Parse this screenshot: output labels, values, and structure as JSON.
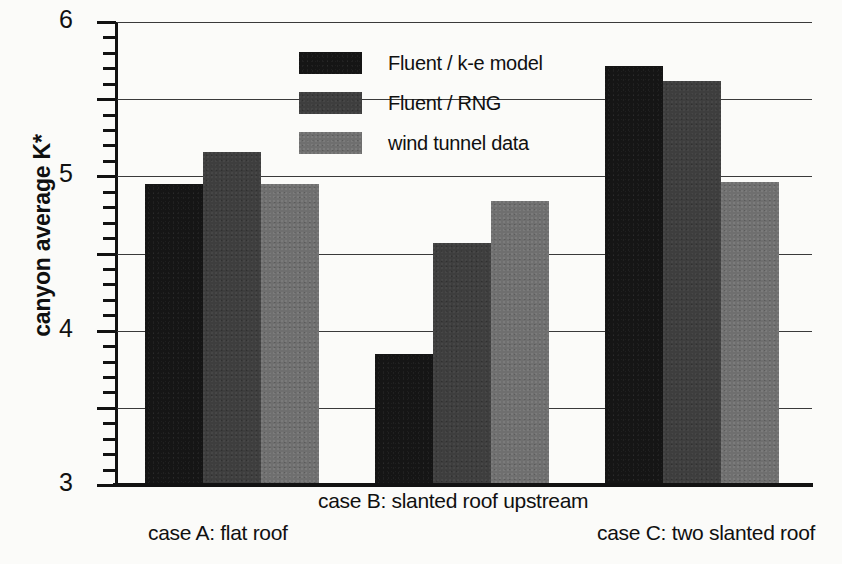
{
  "chart_data": {
    "type": "bar",
    "title": "",
    "xlabel": "",
    "ylabel": "canyon average K*",
    "ylim": [
      0,
      6
    ],
    "ytick_labels": [
      "6",
      "5",
      "4",
      "3",
      "2",
      "1",
      "0"
    ],
    "ytick_values": [
      6,
      5,
      4,
      3,
      2,
      1,
      0
    ],
    "minor_ticks_per_interval": 4,
    "grid": "horizontal",
    "legend_position": "upper-center",
    "categories": [
      "case A: flat roof",
      "case B: slanted roof upstream",
      "case C: two slanted roof"
    ],
    "series": [
      {
        "name": "Fluent / k-e model",
        "color": "#151515",
        "values": [
          3.88,
          1.67,
          5.4
        ]
      },
      {
        "name": "Fluent / RNG",
        "color": "#3e3e3e",
        "values": [
          4.29,
          3.11,
          5.21
        ]
      },
      {
        "name": "wind tunnel data",
        "color": "#6f6f6f",
        "values": [
          3.88,
          3.66,
          3.9
        ]
      }
    ]
  },
  "axis": {
    "y_title": "canyon average K*"
  },
  "legend": {
    "items": [
      {
        "label": "Fluent / k-e model"
      },
      {
        "label": "Fluent / RNG"
      },
      {
        "label": "wind tunnel data"
      }
    ]
  },
  "categories": {
    "a": "case A: flat roof",
    "b": "case B: slanted roof upstream",
    "c": "case C: two slanted roof"
  }
}
